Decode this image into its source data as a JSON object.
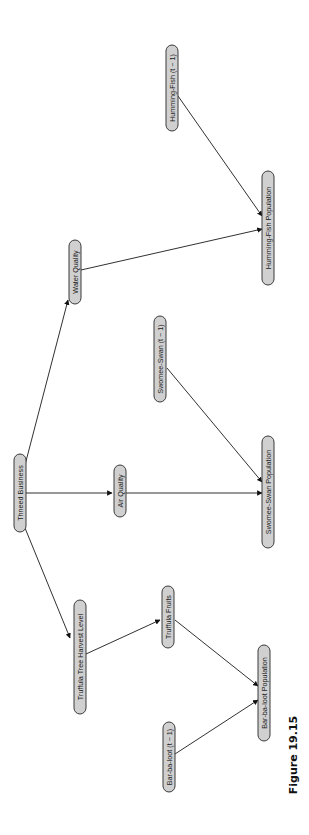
{
  "figure": {
    "caption": "Figure 19.15",
    "orientation": "rotated 90 degrees counter-clockwise"
  },
  "nodes": {
    "thneed_business": "Thneed Business",
    "truffula_harvest": "Truffula Tree Harvest Level",
    "air_quality": "Air Quality",
    "water_quality": "Water Quality",
    "truffula_fruits": "Truffula Fruits",
    "swomee_prev": "Swomee-Swan (t − 1)",
    "humfish_prev": "Humming-Fish (t − 1)",
    "barbaloot_prev": "Bar-ba-loot (t − 1)",
    "swomee_pop": "Swomee-Swan Population",
    "humfish_pop": "Humming-Fish Population",
    "barbaloot_pop": "Bar-ba-loot Population"
  },
  "edges": [
    {
      "from": "Thneed Business",
      "to": "Truffula Tree Harvest Level"
    },
    {
      "from": "Thneed Business",
      "to": "Air Quality"
    },
    {
      "from": "Thneed Business",
      "to": "Water Quality"
    },
    {
      "from": "Truffula Tree Harvest Level",
      "to": "Truffula Fruits"
    },
    {
      "from": "Truffula Fruits",
      "to": "Bar-ba-loot Population"
    },
    {
      "from": "Bar-ba-loot (t − 1)",
      "to": "Bar-ba-loot Population"
    },
    {
      "from": "Air Quality",
      "to": "Swomee-Swan Population"
    },
    {
      "from": "Swomee-Swan (t − 1)",
      "to": "Swomee-Swan Population"
    },
    {
      "from": "Water Quality",
      "to": "Humming-Fish Population"
    },
    {
      "from": "Humming-Fish (t − 1)",
      "to": "Humming-Fish Population"
    }
  ]
}
